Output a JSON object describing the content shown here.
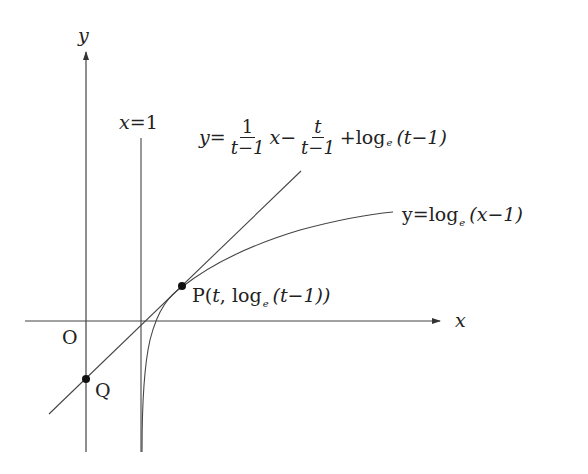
{
  "diagram": {
    "type": "function-graph",
    "axes": {
      "x_label": "x",
      "y_label": "y",
      "origin_label": "O"
    },
    "asymptote": {
      "label_lhs": "x",
      "label_eq": "=",
      "label_rhs": "1"
    },
    "tangent_line": {
      "label_y": "y",
      "label_eq": "=",
      "frac1_num": "1",
      "frac1_den": "t−1",
      "x": "x",
      "minus": "−",
      "frac2_num": "t",
      "frac2_den": "t−1",
      "tail_plus": "+log",
      "tail_sub": "e",
      "tail_arg": "(t−1)"
    },
    "curve": {
      "label_prefix": "y=log",
      "label_sub": "e",
      "label_arg": "(x−1)"
    },
    "points": {
      "P": {
        "name": "P",
        "open": "(",
        "t": "t",
        "comma": ", log",
        "sub": "e",
        "arg": "(t−1))"
      },
      "Q": {
        "name": "Q"
      }
    },
    "colors": {
      "stroke": "#333333",
      "background": "#ffffff"
    }
  }
}
